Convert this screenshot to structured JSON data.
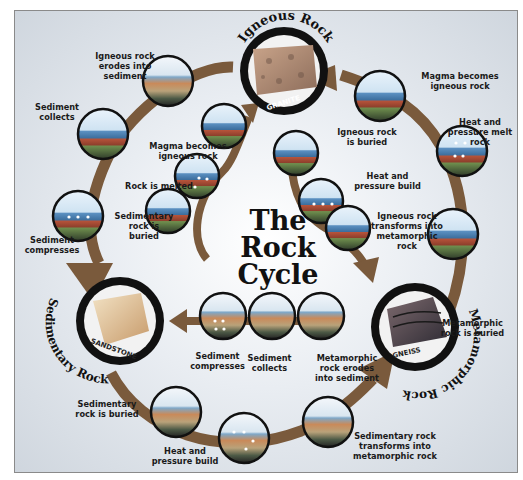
{
  "title": "The\nRock\nCycle",
  "rock_types": {
    "igneous": {
      "heading": "Igneous Rock",
      "specimen": "GRANITE"
    },
    "sedimentary": {
      "heading": "Sedimentary Rock",
      "specimen": "SANDSTONE"
    },
    "metamorphic": {
      "heading": "Metamorphic Rock",
      "specimen": "GNEISS"
    }
  },
  "outer_cycle_labels": {
    "igneous_erodes": "Igneous rock\nerodes into\nsediment",
    "sediment_collects": "Sediment\ncollects",
    "sediment_compresses": "Sediment\ncompresses",
    "sedimentary_buried": "Sedimentary\nrock is buried",
    "heat_pressure_build": "Heat and\npressure build",
    "sedimentary_transforms": "Sedimentary rock\ntransforms into\nmetamorphic rock",
    "metamorphic_buried": "Metamorphic\nrock is buried",
    "heat_pressure_melt": "Heat and\npressure melt\nrock",
    "magma_becomes": "Magma becomes\nigneous rock"
  },
  "inner_cycle_labels": {
    "magma_becomes": "Magma becomes\nigneous rock",
    "rock_melted": "Rock is melted",
    "sedimentary_buried": "Sedimentary\nrock is\nburied",
    "igneous_buried": "Igneous rock\nis buried",
    "heat_pressure_build": "Heat and\npressure build",
    "igneous_transforms": "Igneous rock\ntransforms into\nmetamorphic\nrock",
    "sediment_compresses": "Sediment\ncompresses",
    "sediment_collects": "Sediment\ncollects",
    "metamorphic_erodes": "Metamorphic\nrock erodes\ninto sediment"
  },
  "colors": {
    "arrow": "#7a5a3c",
    "ring": "#111111",
    "sky": "#cfe3f2",
    "water": "#3d7fb8",
    "rock_red": "#b5533a",
    "rock_green": "#5f8a4a",
    "magma": "#d8572a"
  }
}
